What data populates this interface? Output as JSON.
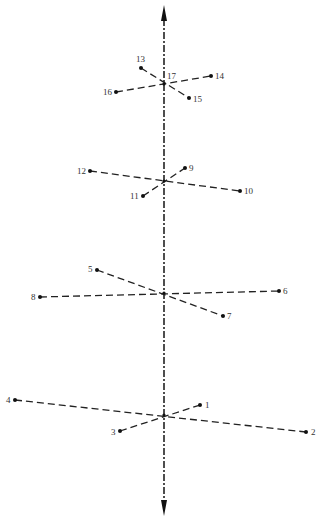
{
  "diagram": {
    "axis": {
      "x": 164,
      "y_top": 5,
      "y_bottom": 516,
      "style": "dash-dot",
      "arrows": "both-ends"
    },
    "ink_color": "#222222",
    "groups": [
      {
        "name": "group-1",
        "center": {
          "x": 164,
          "y": 415
        },
        "segments": [
          [
            "4",
            "2"
          ],
          [
            "3",
            "1"
          ]
        ],
        "points": [
          {
            "id": "1",
            "label": "1",
            "x": 200,
            "y": 405,
            "lx": 205,
            "ly": 408
          },
          {
            "id": "2",
            "label": "2",
            "x": 306,
            "y": 432,
            "lx": 311,
            "ly": 435
          },
          {
            "id": "3",
            "label": "3",
            "x": 120,
            "y": 431,
            "lx": 111,
            "ly": 435
          },
          {
            "id": "4",
            "label": "4",
            "x": 15,
            "y": 400,
            "lx": 6,
            "ly": 403
          }
        ]
      },
      {
        "name": "group-2",
        "center": {
          "x": 164,
          "y": 293
        },
        "segments": [
          [
            "8",
            "6"
          ],
          [
            "5",
            "7"
          ]
        ],
        "points": [
          {
            "id": "5",
            "label": "5",
            "x": 97,
            "y": 270,
            "lx": 88,
            "ly": 272
          },
          {
            "id": "6",
            "label": "6",
            "x": 279,
            "y": 291,
            "lx": 283,
            "ly": 294
          },
          {
            "id": "7",
            "label": "7",
            "x": 223,
            "y": 316,
            "lx": 227,
            "ly": 319
          },
          {
            "id": "8",
            "label": "8",
            "x": 40,
            "y": 297,
            "lx": 31,
            "ly": 300
          }
        ]
      },
      {
        "name": "group-3",
        "center": {
          "x": 164,
          "y": 181
        },
        "segments": [
          [
            "12",
            "10"
          ],
          [
            "11",
            "9"
          ]
        ],
        "points": [
          {
            "id": "9",
            "label": "9",
            "x": 185,
            "y": 168,
            "lx": 189,
            "ly": 171
          },
          {
            "id": "10",
            "label": "10",
            "x": 240,
            "y": 191,
            "lx": 244,
            "ly": 194
          },
          {
            "id": "11",
            "label": "11",
            "x": 143,
            "y": 196,
            "lx": 130,
            "ly": 199
          },
          {
            "id": "12",
            "label": "12",
            "x": 90,
            "y": 171,
            "lx": 77,
            "ly": 174
          }
        ]
      },
      {
        "name": "group-4",
        "center": {
          "x": 164,
          "y": 84
        },
        "center_label": {
          "text": "17",
          "x": 167,
          "y": 79
        },
        "segments": [
          [
            "16",
            "14"
          ],
          [
            "13",
            "15"
          ]
        ],
        "points": [
          {
            "id": "13",
            "label": "13",
            "x": 141,
            "y": 68,
            "lx": 136,
            "ly": 62
          },
          {
            "id": "14",
            "label": "14",
            "x": 211,
            "y": 76,
            "lx": 215,
            "ly": 79
          },
          {
            "id": "15",
            "label": "15",
            "x": 189,
            "y": 98,
            "lx": 193,
            "ly": 102
          },
          {
            "id": "16",
            "label": "16",
            "x": 116,
            "y": 92,
            "lx": 103,
            "ly": 95
          }
        ]
      }
    ]
  }
}
